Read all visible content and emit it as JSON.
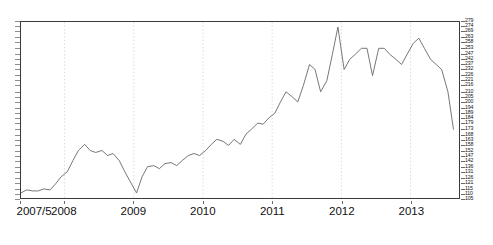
{
  "chart_data": {
    "type": "line",
    "title": "",
    "subtitle": "",
    "xlabel": "",
    "ylabel": "",
    "grid": true,
    "grid_style": "dotted vertical year gridlines",
    "legend": "none",
    "line_color": "#666666",
    "background": "#ffffff",
    "frame_color": "#3a3a3a",
    "xlim": [
      "2007/5",
      "2013/8"
    ],
    "ylim": [
      105,
      279
    ],
    "x_tick_labels": [
      "2007/5",
      "2008",
      "2009",
      "2010",
      "2011",
      "2012",
      "2013"
    ],
    "x_tick_values": [
      2007.37,
      2008.0,
      2009.0,
      2010.0,
      2011.0,
      2012.0,
      2013.0
    ],
    "y_tick_labels": [
      "279",
      "274",
      "269",
      "263",
      "258",
      "253",
      "247",
      "242",
      "237",
      "232",
      "226",
      "221",
      "216",
      "210",
      "205",
      "200",
      "194",
      "189",
      "184",
      "179",
      "173",
      "168",
      "163",
      "158",
      "152",
      "147",
      "142",
      "136",
      "131",
      "126",
      "121",
      "115",
      "110",
      "105"
    ],
    "y_tick_values": [
      279,
      274,
      269,
      263,
      258,
      253,
      247,
      242,
      237,
      232,
      226,
      221,
      216,
      210,
      205,
      200,
      194,
      189,
      184,
      179,
      173,
      168,
      163,
      158,
      152,
      147,
      142,
      136,
      131,
      126,
      121,
      115,
      110,
      105
    ],
    "x": [
      2007.37,
      2007.45,
      2007.54,
      2007.62,
      2007.7,
      2007.79,
      2007.87,
      2007.95,
      2008.04,
      2008.12,
      2008.2,
      2008.29,
      2008.37,
      2008.45,
      2008.54,
      2008.62,
      2008.7,
      2008.79,
      2008.87,
      2008.95,
      2009.04,
      2009.12,
      2009.2,
      2009.29,
      2009.37,
      2009.45,
      2009.54,
      2009.62,
      2009.7,
      2009.79,
      2009.87,
      2009.95,
      2010.04,
      2010.12,
      2010.2,
      2010.29,
      2010.37,
      2010.45,
      2010.54,
      2010.62,
      2010.7,
      2010.79,
      2010.87,
      2010.95,
      2011.04,
      2011.12,
      2011.2,
      2011.29,
      2011.37,
      2011.45,
      2011.54,
      2011.62,
      2011.7,
      2011.79,
      2011.87,
      2011.95,
      2012.04,
      2012.12,
      2012.2,
      2012.29,
      2012.37,
      2012.45,
      2012.54,
      2012.62,
      2012.7,
      2012.79,
      2012.87,
      2012.95,
      2013.04,
      2013.12,
      2013.2,
      2013.29,
      2013.37,
      2013.45,
      2013.54,
      2013.62
    ],
    "values": [
      110,
      113,
      112,
      112,
      114,
      113,
      119,
      126,
      131,
      142,
      152,
      158,
      152,
      150,
      152,
      147,
      149,
      142,
      131,
      121,
      110,
      126,
      136,
      137,
      134,
      139,
      140,
      137,
      142,
      147,
      149,
      147,
      152,
      158,
      163,
      161,
      157,
      163,
      158,
      168,
      173,
      179,
      178,
      184,
      189,
      200,
      210,
      205,
      200,
      216,
      237,
      232,
      210,
      221,
      247,
      274,
      232,
      242,
      247,
      253,
      253,
      226,
      253,
      253,
      247,
      242,
      237,
      247,
      258,
      263,
      253,
      242,
      237,
      232,
      210,
      173
    ],
    "series_name": "index",
    "peak": {
      "x": 2011.95,
      "y": 274
    },
    "trough": {
      "x": 2009.04,
      "y": 110
    },
    "start": {
      "x": 2007.37,
      "y": 110
    },
    "end": {
      "x": 2013.62,
      "y": 173
    }
  },
  "axes": {
    "y_axis_position": "right",
    "x_axis_position": "bottom"
  }
}
